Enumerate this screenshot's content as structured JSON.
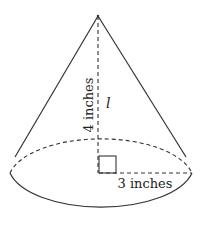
{
  "diagram": {
    "type": "right circular cone",
    "labels": {
      "height": "4 inches",
      "slant": "l",
      "radius": "3 inches"
    },
    "colors": {
      "stroke": "#333333",
      "background": "#ffffff"
    }
  }
}
